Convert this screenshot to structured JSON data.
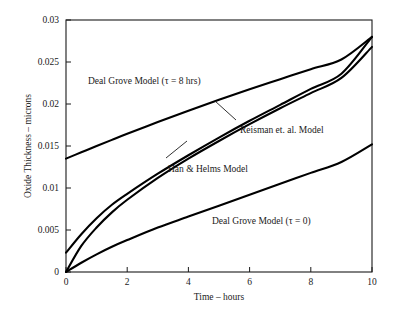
{
  "chart_data": {
    "type": "line",
    "title": "",
    "xlabel": "Time – hours",
    "ylabel": "Oxide Thickness – microns",
    "xlim": [
      0,
      10
    ],
    "ylim": [
      0,
      0.03
    ],
    "grid": false,
    "legend_position": "inline-annotations",
    "xticks": [
      0,
      2,
      4,
      6,
      8,
      10
    ],
    "xtick_labels": [
      "0",
      "2",
      "4",
      "6",
      "8",
      "10"
    ],
    "yticks": [
      0,
      0.005,
      0.01,
      0.015,
      0.02,
      0.025,
      0.03
    ],
    "ytick_labels": [
      "0",
      "0.005",
      "0.01",
      "0.015",
      "0.02",
      "0.025",
      "0.03"
    ],
    "x": [
      0,
      0.5,
      1,
      1.5,
      2,
      3,
      4,
      5,
      6,
      7,
      8,
      9,
      10
    ],
    "series": [
      {
        "name": "Deal Grove Model (τ = 8 hrs)",
        "label": "Deal Grove Model (τ = 8 hrs)",
        "color": "#000000",
        "values": [
          0.0135,
          0.01425,
          0.015,
          0.01573,
          0.01645,
          0.01785,
          0.0192,
          0.0205,
          0.02175,
          0.02295,
          0.02415,
          0.0253,
          0.028
        ]
      },
      {
        "name": "Reisman et. al. Model",
        "label": "Reisman et. al. Model",
        "color": "#000000",
        "values": [
          0.0023,
          0.0045,
          0.0064,
          0.008,
          0.0093,
          0.0117,
          0.0139,
          0.016,
          0.018,
          0.0199,
          0.0218,
          0.0236,
          0.028
        ]
      },
      {
        "name": "Han & Helms Model",
        "label": "Han & Helms Model",
        "color": "#000000",
        "values": [
          0.0,
          0.0031,
          0.0053,
          0.0071,
          0.0086,
          0.0112,
          0.0135,
          0.0156,
          0.0176,
          0.0195,
          0.0213,
          0.0231,
          0.0268
        ]
      },
      {
        "name": "Deal Grove Model (τ = 0)",
        "label": "Deal Grove Model (τ = 0)",
        "color": "#000000",
        "values": [
          0.0,
          0.0011,
          0.0021,
          0.003,
          0.0038,
          0.0053,
          0.0066,
          0.0079,
          0.0092,
          0.0105,
          0.0118,
          0.0131,
          0.0152
        ]
      }
    ],
    "annotations": [
      {
        "id": "deal-grove-tau8",
        "text": "Deal Grove Model (τ = 8 hrs)",
        "leader": false
      },
      {
        "id": "reisman",
        "text": "Reisman et. al. Model",
        "leader": true
      },
      {
        "id": "han-helms",
        "text": "Han & Helms Model",
        "leader": true
      },
      {
        "id": "deal-grove-tau0",
        "text": "Deal Grove Model (τ = 0)",
        "leader": false
      }
    ]
  }
}
